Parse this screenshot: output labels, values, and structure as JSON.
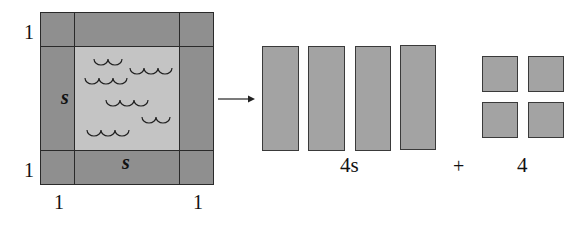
{
  "diagram": {
    "pool": {
      "labels": {
        "top_left_side": "1",
        "bottom_left_side": "1",
        "bottom_left_under": "1",
        "bottom_right_under": "1",
        "left_strip": "s",
        "bottom_strip": "s"
      },
      "water_icon": "waves-icon"
    },
    "arrow_icon": "arrow-right-icon",
    "strips": {
      "count": 4,
      "label": "4s"
    },
    "plus_sign": "+",
    "squares": {
      "count": 4,
      "label": "4"
    },
    "colors": {
      "border_tiles": "#8f8f8f",
      "water": "#c4c4c4",
      "pieces": "#a3a3a3",
      "lines": "#2a2a2a"
    }
  }
}
